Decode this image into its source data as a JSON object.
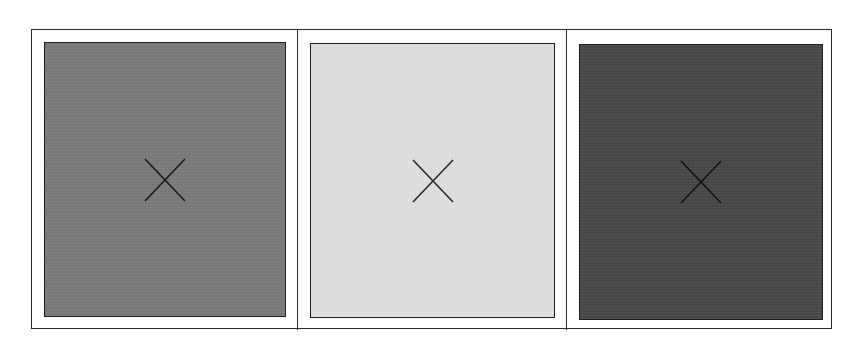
{
  "diagram": {
    "frame": {
      "border_color": "#2a2a2a",
      "background": "#ffffff"
    },
    "panels": [
      {
        "name": "medium-gray",
        "fill": "#7a7a7a",
        "marker": "x-mark",
        "marker_color": "#1a1a1a"
      },
      {
        "name": "light-gray",
        "fill": "#dedede",
        "marker": "x-mark",
        "marker_color": "#2a2a2a"
      },
      {
        "name": "dark-gray",
        "fill": "#484848",
        "marker": "x-mark",
        "marker_color": "#111111"
      }
    ]
  }
}
